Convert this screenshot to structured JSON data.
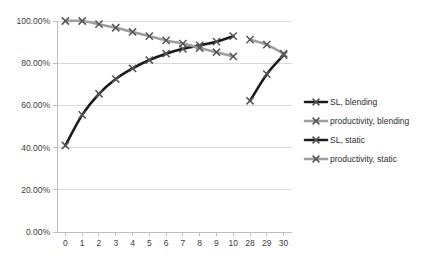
{
  "chart_data": {
    "type": "line",
    "title": "",
    "xlabel": "",
    "ylabel": "",
    "categories": [
      "0",
      "1",
      "2",
      "3",
      "4",
      "5",
      "6",
      "7",
      "8",
      "9",
      "10",
      "28",
      "29",
      "30"
    ],
    "ylim": [
      0,
      1.0
    ],
    "ytick_labels": [
      "0.00%",
      "20.00%",
      "40.00%",
      "60.00%",
      "80.00%",
      "100.00%"
    ],
    "ytick_values": [
      0,
      0.2,
      0.4,
      0.6,
      0.8,
      1.0
    ],
    "grid": true,
    "legend_position": "right",
    "marker": "x",
    "series": [
      {
        "name": "SL, blending",
        "color": "#1a1a1a",
        "x": [
          "0",
          "1",
          "2",
          "3",
          "4",
          "5",
          "6",
          "7",
          "8",
          "9",
          "10"
        ],
        "values": [
          0.41,
          0.555,
          0.655,
          0.725,
          0.775,
          0.815,
          0.845,
          0.868,
          0.885,
          0.902,
          0.928
        ]
      },
      {
        "name": "productivity, blending",
        "color": "#9e9e9e",
        "x": [
          "0",
          "1",
          "2",
          "3",
          "4",
          "5",
          "6",
          "7",
          "8",
          "9",
          "10"
        ],
        "values": [
          1.0,
          1.0,
          0.985,
          0.968,
          0.948,
          0.928,
          0.908,
          0.893,
          0.872,
          0.852,
          0.832
        ]
      },
      {
        "name": "SL, static",
        "color": "#1a1a1a",
        "x": [
          "28",
          "29",
          "30"
        ],
        "values": [
          0.622,
          0.748,
          0.838
        ]
      },
      {
        "name": "productivity, static",
        "color": "#9e9e9e",
        "x": [
          "28",
          "29",
          "30"
        ],
        "values": [
          0.912,
          0.888,
          0.845
        ]
      }
    ]
  },
  "legend": {
    "items": [
      {
        "label": "SL, blending",
        "color": "#1a1a1a",
        "marker": "x"
      },
      {
        "label": "productivity, blending",
        "color": "#9e9e9e",
        "marker": "x"
      },
      {
        "label": "SL, static",
        "color": "#1a1a1a",
        "marker": "x"
      },
      {
        "label": "productivity, static",
        "color": "#9e9e9e",
        "marker": "x"
      }
    ]
  }
}
